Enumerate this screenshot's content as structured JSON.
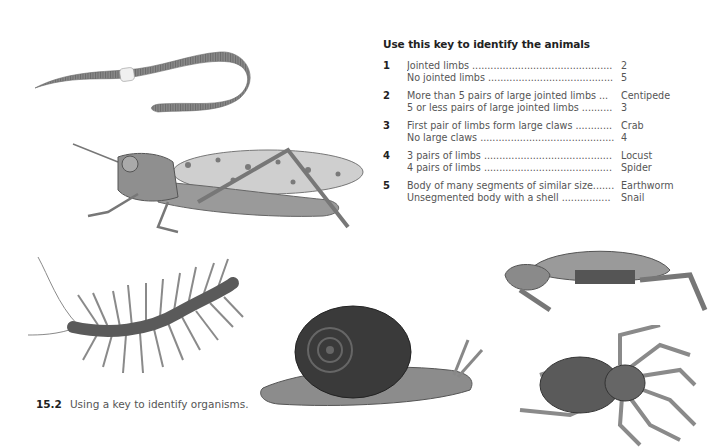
{
  "key": {
    "title": "Use this key to identify the animals",
    "couplets": [
      {
        "number": "1",
        "lines": [
          "Jointed limbs ..............................................",
          "No jointed limbs ........................................."
        ],
        "results": [
          "2",
          "5"
        ]
      },
      {
        "number": "2",
        "lines": [
          "More than 5 pairs of large jointed limbs ...",
          "5 or less pairs of large jointed limbs .........."
        ],
        "results": [
          "Centipede",
          "3"
        ]
      },
      {
        "number": "3",
        "lines": [
          "First pair of limbs form large claws ............",
          "No large claws ............................................"
        ],
        "results": [
          "Crab",
          "4"
        ]
      },
      {
        "number": "4",
        "lines": [
          "3 pairs of limbs ..........................................",
          "4 pairs of limbs .........................................."
        ],
        "results": [
          "Locust",
          "Spider"
        ]
      },
      {
        "number": "5",
        "lines": [
          "Body of many segments of similar size.......",
          "Unsegmented body with a shell ................"
        ],
        "results": [
          "Earthworm",
          "Snail"
        ]
      }
    ]
  },
  "caption": {
    "number": "15.2",
    "text": "Using a key to identify organisms."
  },
  "illustrations": [
    "earthworm",
    "locust",
    "centipede",
    "snail",
    "crab",
    "spider"
  ],
  "colors": {
    "text": "#555555",
    "heading": "#222222",
    "background": "#ffffff"
  }
}
